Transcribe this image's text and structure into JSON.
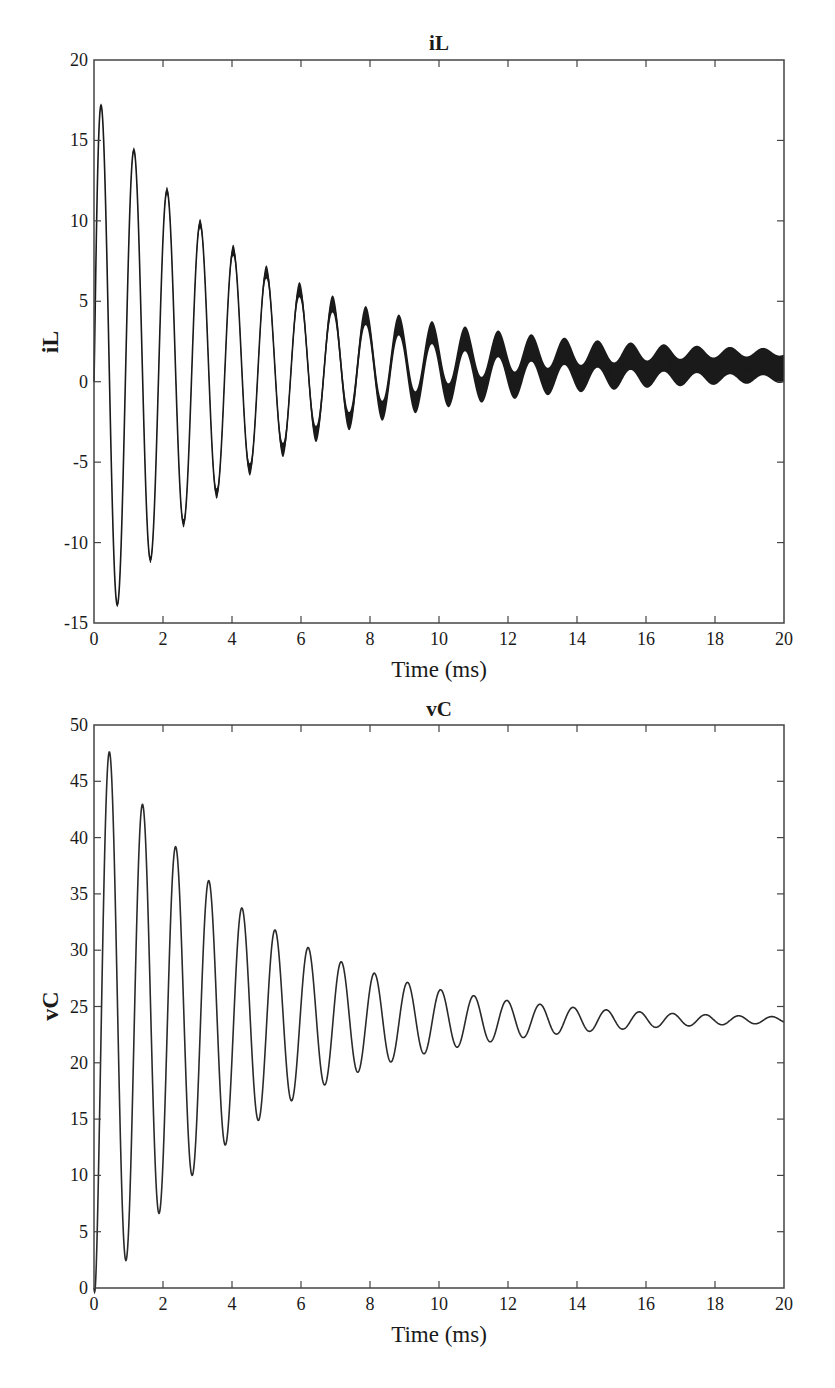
{
  "chart_data": [
    {
      "type": "line",
      "title": "iL",
      "xlabel": "Time (ms)",
      "ylabel": "iL",
      "xlim": [
        0,
        20
      ],
      "ylim": [
        -15,
        20
      ],
      "xticks": [
        0,
        2,
        4,
        6,
        8,
        10,
        12,
        14,
        16,
        18,
        20
      ],
      "yticks": [
        -15,
        -10,
        -5,
        0,
        5,
        10,
        15,
        20
      ],
      "grid": false,
      "legend": null,
      "frame": {
        "left": 94,
        "right": 784,
        "top": 60,
        "bottom": 623
      },
      "model": {
        "steady": 1.0,
        "amplitude": 16.5,
        "tau_ms": 4.6,
        "period_ms": 0.96,
        "first_peak_ms": 0.2,
        "ripple_start": 0.1,
        "ripple_end": 0.85,
        "start_value": 0
      },
      "series": [
        {
          "name": "iL",
          "x": [
            0,
            0.2,
            0.68,
            1.17,
            1.65,
            2.13,
            2.6,
            3.07,
            3.55,
            4.03,
            4.5,
            5.0,
            5.45,
            5.95,
            6.42,
            6.9,
            7.38,
            7.85,
            8.35,
            8.82,
            9.3,
            9.8,
            10.25,
            10.75,
            11.2,
            11.7,
            12.2,
            12.65,
            13.15,
            13.6,
            14.1,
            14.6,
            15.05,
            15.55,
            16.0,
            16.5,
            17.0,
            17.45,
            17.95,
            18.4,
            18.9,
            19.4,
            20.0
          ],
          "y": [
            0,
            16.0,
            -12.7,
            13.3,
            -10.0,
            11.0,
            -8.0,
            9.2,
            -6.3,
            7.6,
            -5.0,
            6.5,
            -3.9,
            5.3,
            -3.1,
            4.6,
            -2.5,
            4.1,
            -1.9,
            3.6,
            -1.4,
            3.2,
            -1.0,
            2.8,
            -0.7,
            2.6,
            -0.4,
            2.4,
            -0.2,
            2.2,
            0.0,
            2.0,
            0.1,
            1.9,
            0.2,
            1.8,
            0.3,
            1.7,
            0.3,
            1.7,
            0.4,
            1.6,
            1.0
          ]
        }
      ]
    },
    {
      "type": "line",
      "title": "vC",
      "xlabel": "Time (ms)",
      "ylabel": "vC",
      "xlim": [
        0,
        20
      ],
      "ylim": [
        0,
        50
      ],
      "xticks": [
        0,
        2,
        4,
        6,
        8,
        10,
        12,
        14,
        16,
        18,
        20
      ],
      "yticks": [
        0,
        5,
        10,
        15,
        20,
        25,
        30,
        35,
        40,
        45,
        50
      ],
      "grid": false,
      "legend": null,
      "frame": {
        "left": 94,
        "right": 784,
        "top": 725,
        "bottom": 1288
      },
      "model": {
        "steady": 23.8,
        "amplitude": 23.8,
        "tau_ms": 4.4,
        "period_ms": 0.96,
        "first_peak_ms": 0.45,
        "start_value": 0
      },
      "series": [
        {
          "name": "vC",
          "x": [
            0,
            0.45,
            0.93,
            1.42,
            1.9,
            2.38,
            2.85,
            3.33,
            3.8,
            4.3,
            4.77,
            5.25,
            5.72,
            6.2,
            6.68,
            7.15,
            7.63,
            8.12,
            8.6,
            9.08,
            9.55,
            10.02,
            10.5,
            11.0,
            11.47,
            11.95,
            12.42,
            12.9,
            13.38,
            13.85,
            14.33,
            14.8,
            15.28,
            15.75,
            16.25,
            16.72,
            17.2,
            17.68,
            18.15,
            18.62,
            19.1,
            19.6,
            20.0
          ],
          "y": [
            0,
            45.5,
            4.8,
            41.2,
            8.8,
            37.8,
            11.7,
            35.0,
            14.2,
            32.8,
            16.2,
            31.0,
            17.7,
            29.6,
            19.0,
            28.4,
            20.0,
            27.5,
            20.8,
            26.8,
            21.5,
            26.2,
            22.0,
            25.7,
            22.4,
            25.3,
            22.7,
            25.0,
            23.0,
            24.8,
            23.2,
            24.6,
            23.4,
            24.4,
            23.5,
            24.3,
            23.6,
            24.2,
            23.7,
            24.1,
            23.8,
            24.0,
            23.8
          ]
        }
      ]
    }
  ],
  "charts": {
    "il": {
      "title": "iL",
      "ylabel": "iL",
      "xlabel": "Time (ms)",
      "xtick_labels": [
        "0",
        "2",
        "4",
        "6",
        "8",
        "10",
        "12",
        "14",
        "16",
        "18",
        "20"
      ],
      "ytick_labels": [
        "-15",
        "-10",
        "-5",
        "0",
        "5",
        "10",
        "15",
        "20"
      ]
    },
    "vc": {
      "title": "vC",
      "ylabel": "vC",
      "xlabel": "Time (ms)",
      "xtick_labels": [
        "0",
        "2",
        "4",
        "6",
        "8",
        "10",
        "12",
        "14",
        "16",
        "18",
        "20"
      ],
      "ytick_labels": [
        "0",
        "5",
        "10",
        "15",
        "20",
        "25",
        "30",
        "35",
        "40",
        "45",
        "50"
      ]
    }
  },
  "colors": {
    "line": "#1a1a1a",
    "axis": "#444444",
    "background": "#ffffff"
  }
}
